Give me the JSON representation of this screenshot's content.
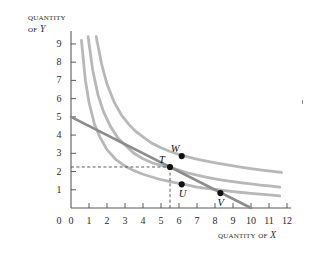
{
  "figure": {
    "y_axis_title_line1": "Quantity",
    "y_axis_title_line2_prefix": "of ",
    "y_axis_title_line2_var": "Y",
    "x_axis_title_prefix": "Quantity of ",
    "x_axis_title_var": "X",
    "curve_color": "#b8b8b8",
    "budget_line_color": "#8c8c8c",
    "axis_color": "#5a5a5a",
    "point_color": "#111111",
    "dashed_color": "#4a4a4a",
    "background": "#ffffff"
  },
  "chart_data": {
    "type": "line",
    "title": "",
    "xlabel": "Quantity of X",
    "ylabel": "Quantity of Y",
    "xlim": [
      0,
      12
    ],
    "ylim": [
      0,
      9.6
    ],
    "grid": false,
    "legend": "none",
    "xticks": [
      0,
      1,
      2,
      3,
      4,
      5,
      6,
      7,
      8,
      9,
      10,
      11,
      12
    ],
    "yticks": [
      0,
      1,
      2,
      3,
      4,
      5,
      6,
      7,
      8,
      9
    ],
    "series": [
      {
        "name": "indifference curve 1 (lowest)",
        "kind": "indifference-curve",
        "color": "#b8b8b8",
        "utility_constant": 5.3,
        "x": [
          0.58,
          0.8,
          1.0,
          1.3,
          1.6,
          2.0,
          2.5,
          3.0,
          3.5,
          4.0,
          4.5,
          5.0,
          5.5,
          6.0,
          6.5,
          7.0,
          7.5,
          8.0,
          8.5,
          9.0,
          9.5,
          10.0,
          10.5,
          11.0,
          11.6
        ],
        "y": [
          9.2,
          7.0,
          5.8,
          4.6,
          3.9,
          3.2,
          2.65,
          2.3,
          2.05,
          1.85,
          1.7,
          1.55,
          1.45,
          1.35,
          1.25,
          1.15,
          1.08,
          1.02,
          0.96,
          0.9,
          0.85,
          0.8,
          0.76,
          0.72,
          0.66
        ]
      },
      {
        "name": "indifference curve 2 (middle, tangent at T)",
        "kind": "indifference-curve",
        "color": "#b8b8b8",
        "utility_constant": 8.9,
        "x": [
          0.95,
          1.2,
          1.5,
          1.8,
          2.2,
          2.6,
          3.0,
          3.5,
          4.0,
          4.5,
          5.0,
          5.5,
          6.0,
          6.5,
          7.0,
          7.5,
          8.0,
          8.5,
          9.0,
          9.5,
          10.0,
          10.5,
          11.0,
          11.6
        ],
        "y": [
          9.4,
          7.6,
          6.2,
          5.3,
          4.45,
          3.85,
          3.45,
          3.0,
          2.7,
          2.48,
          2.34,
          2.23,
          2.08,
          1.92,
          1.8,
          1.7,
          1.6,
          1.52,
          1.45,
          1.38,
          1.32,
          1.26,
          1.21,
          1.15
        ]
      },
      {
        "name": "indifference curve 3 (highest, through W)",
        "kind": "indifference-curve",
        "color": "#b8b8b8",
        "utility_constant": 13.0,
        "x": [
          1.4,
          1.7,
          2.0,
          2.4,
          2.8,
          3.2,
          3.6,
          4.0,
          4.5,
          5.0,
          5.5,
          6.1,
          6.6,
          7.1,
          7.6,
          8.1,
          8.6,
          9.1,
          9.6,
          10.1,
          10.6,
          11.1,
          11.7
        ],
        "y": [
          9.4,
          7.9,
          6.8,
          5.8,
          5.1,
          4.6,
          4.2,
          3.9,
          3.55,
          3.3,
          3.1,
          2.9,
          2.78,
          2.66,
          2.56,
          2.46,
          2.38,
          2.3,
          2.22,
          2.15,
          2.08,
          2.02,
          1.95
        ]
      },
      {
        "name": "budget line",
        "kind": "budget-line",
        "color": "#8c8c8c",
        "x": [
          0,
          10
        ],
        "y": [
          5,
          0
        ],
        "slope": -0.5,
        "y_intercept": 5,
        "x_intercept": 10
      }
    ],
    "points": [
      {
        "label": "T",
        "x": 5.5,
        "y": 2.25,
        "label_pos": "upper-left",
        "note": "tangency of budget line and middle indifference curve"
      },
      {
        "label": "W",
        "x": 6.15,
        "y": 2.85,
        "label_pos": "upper-left",
        "note": "on highest indifference curve, above budget line"
      },
      {
        "label": "U",
        "x": 6.15,
        "y": 1.3,
        "label_pos": "below",
        "note": "interior point below budget line"
      },
      {
        "label": "V",
        "x": 8.3,
        "y": 0.82,
        "label_pos": "below",
        "note": "on budget line and lowest indifference curve"
      }
    ],
    "annotations": [
      {
        "kind": "dashed-horizontal",
        "from": [
          0,
          2.25
        ],
        "to": [
          5.5,
          2.25
        ],
        "note": "Y quantity at T"
      },
      {
        "kind": "dashed-vertical",
        "from": [
          5.5,
          0
        ],
        "to": [
          5.5,
          2.25
        ],
        "note": "X quantity at T"
      }
    ]
  },
  "ticks": {
    "x": [
      "0",
      "1",
      "2",
      "3",
      "4",
      "5",
      "6",
      "7",
      "8",
      "9",
      "10",
      "11",
      "12"
    ],
    "y": [
      "0",
      "1",
      "2",
      "3",
      "4",
      "5",
      "6",
      "7",
      "8",
      "9"
    ]
  },
  "point_labels": {
    "t": "T",
    "w": "W",
    "u": "U",
    "v": "V"
  }
}
